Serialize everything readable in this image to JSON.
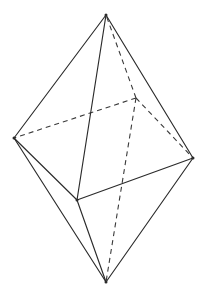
{
  "figure": {
    "kind": "geometric-solid-wireframe",
    "background_color": "#ffffff",
    "solid_edge_color": "#2b2b2b",
    "dashed_edge_color": "#3a3a3a",
    "stroke_width": 1.15,
    "dash_pattern": "5 4",
    "canvas": {
      "width": 203,
      "height": 299
    },
    "labels": [],
    "vertices": [
      {
        "id": "top-apex",
        "name": "top apex",
        "x": 106,
        "y": 15,
        "hidden": false
      },
      {
        "id": "left",
        "name": "left equator vertex",
        "x": 14,
        "y": 138,
        "hidden": false
      },
      {
        "id": "right",
        "name": "right equator vertex",
        "x": 193,
        "y": 158,
        "hidden": false
      },
      {
        "id": "front",
        "name": "front equator vertex",
        "x": 77,
        "y": 200,
        "hidden": false
      },
      {
        "id": "back",
        "name": "back equator vertex",
        "x": 136,
        "y": 98,
        "hidden": true
      },
      {
        "id": "bottom-apex",
        "name": "bottom apex",
        "x": 106,
        "y": 282,
        "hidden": false
      }
    ],
    "edges_solid": [
      {
        "from": "top-apex",
        "to": "left"
      },
      {
        "from": "top-apex",
        "to": "right"
      },
      {
        "from": "top-apex",
        "to": "front"
      },
      {
        "from": "left",
        "to": "front"
      },
      {
        "from": "front",
        "to": "right"
      },
      {
        "from": "left",
        "to": "bottom-apex"
      },
      {
        "from": "right",
        "to": "bottom-apex"
      },
      {
        "from": "front",
        "to": "bottom-apex"
      }
    ],
    "edges_dashed": [
      {
        "from": "back",
        "to": "top-apex"
      },
      {
        "from": "back",
        "to": "left"
      },
      {
        "from": "back",
        "to": "right"
      },
      {
        "from": "back",
        "to": "bottom-apex"
      }
    ]
  }
}
